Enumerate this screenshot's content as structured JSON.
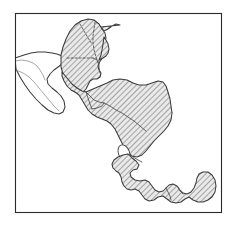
{
  "figure": {
    "title": "Central America distribution map",
    "caption": "",
    "width_px": 237,
    "height_px": 228,
    "background_color": "#ffffff",
    "frame": {
      "label": "map-frame",
      "x": 15,
      "y": 13,
      "width": 207,
      "height": 200,
      "stroke_color": "#2a2a2a",
      "stroke_width": 1.1
    }
  },
  "style": {
    "hatch_label": "diagonal-hatch",
    "hatch_color": "#6e6e6e",
    "hatch_background": "#e9e9e9",
    "hatch_angle_deg": 45,
    "hatch_spacing_px": 2,
    "coast_stroke": "#3a3a3a",
    "internal_border_stroke": "#4a4a4a",
    "unshaded_fill": "#ffffff",
    "lake_fill": "#ffffff"
  },
  "legend": {
    "shaded_meaning": "Shaded (hatched) range",
    "unshaded_meaning": "Unshaded land",
    "lake_meaning": "Lake / inland water"
  },
  "regions": [
    {
      "id": "yucatan-shaded",
      "name": "Yucatan Peninsula and northern Guatemala / Belize",
      "fill": "hatched"
    },
    {
      "id": "southern-mexico-unshaded",
      "name": "Southern Mexico (Isthmus of Tehuantepec, Oaxaca, Chiapas coast)",
      "fill": "plain"
    },
    {
      "id": "guatemala-elsalvador-honduras-nicaragua",
      "name": "Guatemala, El Salvador, Honduras and Nicaragua",
      "fill": "hatched"
    },
    {
      "id": "costa-rica-panama",
      "name": "Costa Rica and Panama isthmus",
      "fill": "hatched"
    },
    {
      "id": "lake-nicaragua",
      "name": "Lake Nicaragua",
      "fill": "water"
    }
  ],
  "chart_data": {
    "type": "map",
    "title": "Central America distribution map",
    "projection": "none",
    "legend_position": "none",
    "grid": false,
    "xlabel": "",
    "ylabel": "",
    "features": [
      {
        "name": "Mexico (Yucatan + Chiapas)",
        "shaded": true
      },
      {
        "name": "Mexico (Tehuantepec / Oaxaca)",
        "shaded": false
      },
      {
        "name": "Belize",
        "shaded": true
      },
      {
        "name": "Guatemala",
        "shaded": true
      },
      {
        "name": "El Salvador",
        "shaded": true
      },
      {
        "name": "Honduras",
        "shaded": true
      },
      {
        "name": "Nicaragua",
        "shaded": true
      },
      {
        "name": "Costa Rica",
        "shaded": true
      },
      {
        "name": "Panama",
        "shaded": true
      },
      {
        "name": "Lake Nicaragua",
        "shaded": false
      }
    ]
  }
}
